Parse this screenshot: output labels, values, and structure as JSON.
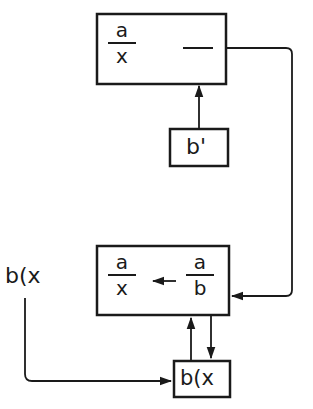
{
  "diagram": {
    "top_box": {
      "fraction": {
        "numerator": "a",
        "denominator": "x"
      },
      "dash": "—"
    },
    "prime_box": {
      "label": "b'"
    },
    "bottom_box": {
      "left_fraction": {
        "numerator": "a",
        "denominator": "x"
      },
      "right_fraction": {
        "numerator": "a",
        "denominator": "b"
      }
    },
    "input_label": "b(x",
    "bx_box": {
      "label": "b(x"
    },
    "colors": {
      "stroke": "#1a1a1a",
      "background": "#ffffff"
    }
  }
}
